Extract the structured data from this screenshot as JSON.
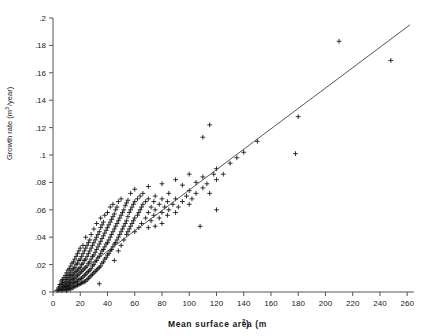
{
  "figure": {
    "background": "#ffffff",
    "width": 431,
    "height": 336
  },
  "chart_data": {
    "type": "scatter",
    "title": "",
    "xlabel": "Mean surface area (m2)",
    "xlabel_base": "Mean surface area (m",
    "xlabel_sup": "2",
    "xlabel_tail": ")",
    "ylabel": "Growth rate (m3/year)",
    "ylabel_base": "Growth rate (m",
    "ylabel_sup": "3",
    "ylabel_tail": "/year)",
    "xlim": [
      0,
      265
    ],
    "ylim": [
      0,
      0.2
    ],
    "xticks": [
      0,
      20,
      40,
      60,
      80,
      100,
      120,
      140,
      160,
      180,
      200,
      220,
      240,
      260
    ],
    "xtick_labels": [
      "0",
      "20",
      "40",
      "60",
      "80",
      "100",
      "120",
      "140",
      "160",
      "180",
      "200",
      "220",
      "240",
      "260"
    ],
    "yticks": [
      0,
      0.02,
      0.04,
      0.06,
      0.08,
      0.1,
      0.12,
      0.14,
      0.16,
      0.18,
      0.2
    ],
    "ytick_labels": [
      "0",
      ".02",
      ".04",
      ".06",
      ".08",
      ".1",
      ".12",
      ".14",
      ".16",
      ".18",
      ".2"
    ],
    "grid": false,
    "legend": null,
    "marker": "plus",
    "marker_color": "#111111",
    "fit_line": {
      "type": "linear",
      "slope": 0.000745,
      "intercept": 0.0,
      "x_start": 0,
      "x_end": 262,
      "y_start": 0.0,
      "y_end": 0.195,
      "color": "#444444"
    },
    "points": [
      [
        3,
        0.001
      ],
      [
        4,
        0.0015
      ],
      [
        4,
        0.003
      ],
      [
        5,
        0.002
      ],
      [
        5,
        0.004
      ],
      [
        5,
        0.0055
      ],
      [
        6,
        0.001
      ],
      [
        6,
        0.003
      ],
      [
        6,
        0.0055
      ],
      [
        6,
        0.008
      ],
      [
        7,
        0.002
      ],
      [
        7,
        0.004
      ],
      [
        7,
        0.006
      ],
      [
        7,
        0.009
      ],
      [
        8,
        0.0015
      ],
      [
        8,
        0.0035
      ],
      [
        8,
        0.005
      ],
      [
        8,
        0.007
      ],
      [
        8,
        0.0105
      ],
      [
        9,
        0.002
      ],
      [
        9,
        0.004
      ],
      [
        9,
        0.0065
      ],
      [
        9,
        0.009
      ],
      [
        9,
        0.012
      ],
      [
        10,
        0.001
      ],
      [
        10,
        0.003
      ],
      [
        10,
        0.005
      ],
      [
        10,
        0.0075
      ],
      [
        10,
        0.0105
      ],
      [
        10,
        0.014
      ],
      [
        11,
        0.002
      ],
      [
        11,
        0.004
      ],
      [
        11,
        0.006
      ],
      [
        11,
        0.009
      ],
      [
        11,
        0.012
      ],
      [
        11,
        0.016
      ],
      [
        12,
        0.0025
      ],
      [
        12,
        0.0045
      ],
      [
        12,
        0.007
      ],
      [
        12,
        0.0095
      ],
      [
        12,
        0.013
      ],
      [
        12,
        0.017
      ],
      [
        13,
        0.002
      ],
      [
        13,
        0.005
      ],
      [
        13,
        0.008
      ],
      [
        13,
        0.011
      ],
      [
        13,
        0.0145
      ],
      [
        13,
        0.019
      ],
      [
        14,
        0.003
      ],
      [
        14,
        0.006
      ],
      [
        14,
        0.009
      ],
      [
        14,
        0.012
      ],
      [
        14,
        0.016
      ],
      [
        14,
        0.021
      ],
      [
        15,
        0.0035
      ],
      [
        15,
        0.0065
      ],
      [
        15,
        0.0095
      ],
      [
        15,
        0.013
      ],
      [
        15,
        0.017
      ],
      [
        15,
        0.022
      ],
      [
        16,
        0.004
      ],
      [
        16,
        0.007
      ],
      [
        16,
        0.01
      ],
      [
        16,
        0.014
      ],
      [
        16,
        0.018
      ],
      [
        16,
        0.024
      ],
      [
        17,
        0.0045
      ],
      [
        17,
        0.0075
      ],
      [
        17,
        0.011
      ],
      [
        17,
        0.015
      ],
      [
        17,
        0.02
      ],
      [
        17,
        0.026
      ],
      [
        18,
        0.005
      ],
      [
        18,
        0.008
      ],
      [
        18,
        0.012
      ],
      [
        18,
        0.016
      ],
      [
        18,
        0.021
      ],
      [
        18,
        0.028
      ],
      [
        19,
        0.0055
      ],
      [
        19,
        0.009
      ],
      [
        19,
        0.013
      ],
      [
        19,
        0.017
      ],
      [
        19,
        0.023
      ],
      [
        19,
        0.03
      ],
      [
        20,
        0.006
      ],
      [
        20,
        0.0095
      ],
      [
        20,
        0.014
      ],
      [
        20,
        0.018
      ],
      [
        20,
        0.024
      ],
      [
        20,
        0.032
      ],
      [
        21,
        0.0065
      ],
      [
        21,
        0.01
      ],
      [
        21,
        0.015
      ],
      [
        21,
        0.02
      ],
      [
        21,
        0.026
      ],
      [
        22,
        0.007
      ],
      [
        22,
        0.011
      ],
      [
        22,
        0.016
      ],
      [
        22,
        0.021
      ],
      [
        22,
        0.028
      ],
      [
        22,
        0.034
      ],
      [
        23,
        0.0075
      ],
      [
        23,
        0.012
      ],
      [
        23,
        0.017
      ],
      [
        23,
        0.023
      ],
      [
        23,
        0.03
      ],
      [
        24,
        0.008
      ],
      [
        24,
        0.013
      ],
      [
        24,
        0.018
      ],
      [
        24,
        0.024
      ],
      [
        24,
        0.032
      ],
      [
        24,
        0.04
      ],
      [
        25,
        0.009
      ],
      [
        25,
        0.014
      ],
      [
        25,
        0.019
      ],
      [
        25,
        0.026
      ],
      [
        25,
        0.034
      ],
      [
        26,
        0.01
      ],
      [
        26,
        0.015
      ],
      [
        26,
        0.021
      ],
      [
        26,
        0.028
      ],
      [
        26,
        0.036
      ],
      [
        27,
        0.011
      ],
      [
        27,
        0.016
      ],
      [
        27,
        0.022
      ],
      [
        27,
        0.03
      ],
      [
        27,
        0.038
      ],
      [
        28,
        0.012
      ],
      [
        28,
        0.017
      ],
      [
        28,
        0.024
      ],
      [
        28,
        0.032
      ],
      [
        28,
        0.042
      ],
      [
        29,
        0.013
      ],
      [
        29,
        0.019
      ],
      [
        29,
        0.026
      ],
      [
        29,
        0.034
      ],
      [
        30,
        0.014
      ],
      [
        30,
        0.02
      ],
      [
        30,
        0.027
      ],
      [
        30,
        0.036
      ],
      [
        30,
        0.046
      ],
      [
        31,
        0.015
      ],
      [
        31,
        0.022
      ],
      [
        31,
        0.029
      ],
      [
        31,
        0.038
      ],
      [
        32,
        0.016
      ],
      [
        32,
        0.023
      ],
      [
        32,
        0.031
      ],
      [
        32,
        0.04
      ],
      [
        32,
        0.05
      ],
      [
        33,
        0.017
      ],
      [
        33,
        0.025
      ],
      [
        33,
        0.033
      ],
      [
        33,
        0.042
      ],
      [
        34,
        0.006
      ],
      [
        34,
        0.018
      ],
      [
        34,
        0.026
      ],
      [
        34,
        0.035
      ],
      [
        34,
        0.044
      ],
      [
        35,
        0.019
      ],
      [
        35,
        0.028
      ],
      [
        35,
        0.037
      ],
      [
        35,
        0.047
      ],
      [
        35,
        0.054
      ],
      [
        36,
        0.021
      ],
      [
        36,
        0.03
      ],
      [
        36,
        0.039
      ],
      [
        36,
        0.049
      ],
      [
        37,
        0.022
      ],
      [
        37,
        0.031
      ],
      [
        37,
        0.041
      ],
      [
        37,
        0.051
      ],
      [
        38,
        0.024
      ],
      [
        38,
        0.033
      ],
      [
        38,
        0.043
      ],
      [
        38,
        0.056
      ],
      [
        39,
        0.025
      ],
      [
        39,
        0.035
      ],
      [
        39,
        0.045
      ],
      [
        40,
        0.027
      ],
      [
        40,
        0.036
      ],
      [
        40,
        0.047
      ],
      [
        40,
        0.058
      ],
      [
        41,
        0.028
      ],
      [
        41,
        0.038
      ],
      [
        41,
        0.049
      ],
      [
        42,
        0.03
      ],
      [
        42,
        0.04
      ],
      [
        42,
        0.051
      ],
      [
        42,
        0.062
      ],
      [
        43,
        0.031
      ],
      [
        43,
        0.042
      ],
      [
        43,
        0.053
      ],
      [
        44,
        0.033
      ],
      [
        44,
        0.044
      ],
      [
        44,
        0.055
      ],
      [
        44,
        0.064
      ],
      [
        45,
        0.023
      ],
      [
        45,
        0.035
      ],
      [
        45,
        0.046
      ],
      [
        45,
        0.057
      ],
      [
        46,
        0.036
      ],
      [
        46,
        0.048
      ],
      [
        46,
        0.06
      ],
      [
        47,
        0.038
      ],
      [
        47,
        0.05
      ],
      [
        47,
        0.062
      ],
      [
        48,
        0.03
      ],
      [
        48,
        0.04
      ],
      [
        48,
        0.052
      ],
      [
        48,
        0.066
      ],
      [
        49,
        0.042
      ],
      [
        49,
        0.054
      ],
      [
        50,
        0.034
      ],
      [
        50,
        0.044
      ],
      [
        50,
        0.056
      ],
      [
        50,
        0.068
      ],
      [
        51,
        0.046
      ],
      [
        51,
        0.058
      ],
      [
        52,
        0.038
      ],
      [
        52,
        0.048
      ],
      [
        52,
        0.06
      ],
      [
        53,
        0.05
      ],
      [
        53,
        0.063
      ],
      [
        54,
        0.042
      ],
      [
        54,
        0.052
      ],
      [
        54,
        0.065
      ],
      [
        55,
        0.044
      ],
      [
        55,
        0.055
      ],
      [
        55,
        0.067
      ],
      [
        56,
        0.046
      ],
      [
        56,
        0.058
      ],
      [
        57,
        0.048
      ],
      [
        57,
        0.06
      ],
      [
        57,
        0.072
      ],
      [
        58,
        0.05
      ],
      [
        58,
        0.062
      ],
      [
        59,
        0.052
      ],
      [
        59,
        0.064
      ],
      [
        60,
        0.044
      ],
      [
        60,
        0.054
      ],
      [
        60,
        0.066
      ],
      [
        60,
        0.075
      ],
      [
        62,
        0.056
      ],
      [
        62,
        0.068
      ],
      [
        63,
        0.047
      ],
      [
        63,
        0.058
      ],
      [
        64,
        0.06
      ],
      [
        64,
        0.07
      ],
      [
        65,
        0.05
      ],
      [
        65,
        0.062
      ],
      [
        66,
        0.064
      ],
      [
        66,
        0.072
      ],
      [
        68,
        0.054
      ],
      [
        68,
        0.066
      ],
      [
        70,
        0.047
      ],
      [
        70,
        0.058
      ],
      [
        70,
        0.068
      ],
      [
        70,
        0.077
      ],
      [
        72,
        0.052
      ],
      [
        72,
        0.062
      ],
      [
        74,
        0.056
      ],
      [
        74,
        0.066
      ],
      [
        75,
        0.048
      ],
      [
        75,
        0.06
      ],
      [
        75,
        0.07
      ],
      [
        78,
        0.054
      ],
      [
        78,
        0.064
      ],
      [
        80,
        0.05
      ],
      [
        80,
        0.058
      ],
      [
        80,
        0.068
      ],
      [
        80,
        0.079
      ],
      [
        82,
        0.062
      ],
      [
        84,
        0.056
      ],
      [
        84,
        0.066
      ],
      [
        85,
        0.06
      ],
      [
        85,
        0.072
      ],
      [
        88,
        0.064
      ],
      [
        90,
        0.058
      ],
      [
        90,
        0.068
      ],
      [
        90,
        0.082
      ],
      [
        92,
        0.062
      ],
      [
        95,
        0.066
      ],
      [
        95,
        0.078
      ],
      [
        98,
        0.07
      ],
      [
        100,
        0.064
      ],
      [
        100,
        0.074
      ],
      [
        100,
        0.086
      ],
      [
        102,
        0.068
      ],
      [
        105,
        0.072
      ],
      [
        105,
        0.08
      ],
      [
        108,
        0.048
      ],
      [
        110,
        0.076
      ],
      [
        110,
        0.084
      ],
      [
        110,
        0.113
      ],
      [
        113,
        0.079
      ],
      [
        115,
        0.072
      ],
      [
        115,
        0.122
      ],
      [
        118,
        0.086
      ],
      [
        120,
        0.06
      ],
      [
        120,
        0.082
      ],
      [
        120,
        0.09
      ],
      [
        125,
        0.086
      ],
      [
        130,
        0.094
      ],
      [
        135,
        0.098
      ],
      [
        140,
        0.102
      ],
      [
        150,
        0.11
      ],
      [
        178,
        0.101
      ],
      [
        180,
        0.128
      ],
      [
        210,
        0.183
      ],
      [
        248,
        0.169
      ]
    ]
  }
}
